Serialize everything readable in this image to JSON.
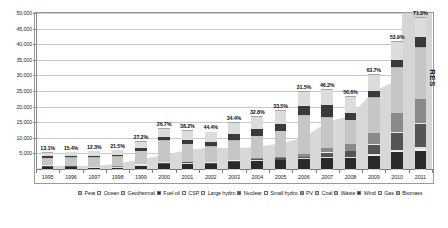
{
  "chart_data": {
    "type": "bar",
    "title": "",
    "subtitle": "",
    "xlabel": "",
    "ylabel": "",
    "ylim": [
      0,
      50000
    ],
    "yticks": [
      "5,000",
      "10,000",
      "15,000",
      "20,000",
      "25,000",
      "30,000",
      "35,000",
      "40,000",
      "45,000",
      "50,000"
    ],
    "ytick_values": [
      5000,
      10000,
      15000,
      20000,
      25000,
      30000,
      35000,
      40000,
      45000,
      50000
    ],
    "grid": true,
    "legend_position": "bottom",
    "stacked": true,
    "categories": [
      "1995",
      "1996",
      "1997",
      "1998",
      "1999",
      "2000",
      "2001",
      "2002",
      "2003",
      "2004",
      "2005",
      "2006",
      "2007",
      "2008",
      "2009",
      "2010",
      "2011"
    ],
    "annotations": [
      "13.1%",
      "15.4%",
      "12.3%",
      "21.5%",
      "27.2%",
      "26.7%",
      "38.2%",
      "44.4%",
      "34.4%",
      "32.8%",
      "33.5%",
      "31.5%",
      "46.2%",
      "56.6%",
      "63.7%",
      "53.9%",
      "71.3%"
    ],
    "annotation_label": "RES share of new capacity",
    "side_band_label": "RES",
    "series": [
      {
        "name": "Peat",
        "color": "#bdbdbd",
        "values": [
          60,
          50,
          40,
          40,
          30,
          30,
          25,
          25,
          20,
          20,
          20,
          15,
          15,
          15,
          10,
          10,
          10
        ]
      },
      {
        "name": "Ocean",
        "color": "#e4e4e4",
        "values": [
          5,
          5,
          5,
          5,
          5,
          5,
          5,
          5,
          5,
          5,
          5,
          5,
          5,
          5,
          5,
          5,
          5
        ]
      },
      {
        "name": "Geothermal",
        "color": "#cfcfcf",
        "values": [
          30,
          30,
          30,
          30,
          30,
          30,
          30,
          30,
          30,
          30,
          30,
          30,
          30,
          30,
          30,
          30,
          30
        ]
      },
      {
        "name": "Fuel oil",
        "color": "#2a2a2a",
        "values": [
          520,
          430,
          300,
          380,
          900,
          1450,
          1600,
          1500,
          2100,
          2450,
          2700,
          3050,
          3450,
          3550,
          4300,
          5400,
          5900
        ]
      },
      {
        "name": "CSP",
        "color": "#f0f0f0",
        "values": [
          0,
          0,
          0,
          0,
          0,
          0,
          0,
          0,
          0,
          10,
          20,
          30,
          60,
          90,
          260,
          450,
          620
        ]
      },
      {
        "name": "Large hydro",
        "color": "#e0e0e0",
        "values": [
          170,
          150,
          140,
          130,
          200,
          220,
          210,
          200,
          230,
          250,
          260,
          280,
          300,
          320,
          350,
          380,
          400
        ]
      },
      {
        "name": "Nuclear",
        "color": "#555555",
        "values": [
          300,
          250,
          180,
          160,
          260,
          320,
          300,
          280,
          340,
          380,
          400,
          430,
          1350,
          1700,
          2900,
          5400,
          7600
        ]
      },
      {
        "name": "Small hydro",
        "color": "#ededed",
        "values": [
          110,
          100,
          95,
          90,
          130,
          140,
          135,
          130,
          150,
          160,
          165,
          175,
          185,
          195,
          210,
          220,
          230
        ]
      },
      {
        "name": "PV",
        "color": "#8a8a8a",
        "values": [
          10,
          12,
          14,
          18,
          25,
          35,
          45,
          60,
          90,
          160,
          300,
          700,
          1300,
          2100,
          3500,
          6000,
          7700
        ]
      },
      {
        "name": "Coal",
        "color": "#c6c6c6",
        "values": [
          2400,
          2600,
          2900,
          3100,
          4100,
          6800,
          5600,
          4900,
          6200,
          7100,
          8200,
          12300,
          9800,
          7600,
          11200,
          14600,
          16400
        ]
      },
      {
        "name": "Waste",
        "color": "#b2b2b2",
        "values": [
          120,
          120,
          110,
          110,
          150,
          160,
          150,
          145,
          170,
          180,
          185,
          190,
          200,
          210,
          230,
          250,
          260
        ]
      },
      {
        "name": "Wind",
        "color": "#3a3a3a",
        "values": [
          350,
          420,
          450,
          520,
          900,
          1100,
          1300,
          1500,
          1900,
          2100,
          2300,
          2900,
          3800,
          2300,
          1900,
          2300,
          3100
        ]
      },
      {
        "name": "Gas",
        "color": "#dcdcdc",
        "values": [
          1200,
          1300,
          1450,
          1500,
          2100,
          2600,
          2900,
          3100,
          3600,
          3900,
          4200,
          4600,
          4900,
          5100,
          5400,
          5800,
          6200
        ]
      },
      {
        "name": "Biomass",
        "color": "#a5a5a5",
        "values": [
          140,
          140,
          140,
          140,
          190,
          200,
          195,
          190,
          220,
          230,
          240,
          250,
          265,
          280,
          300,
          320,
          340
        ]
      }
    ],
    "totals": [
      5415,
      5607,
      5854,
      6223,
      9021,
      13090,
      12495,
      12065,
      15055,
      16975,
      19025,
      24905,
      25660,
      23595,
      30595,
      41165,
      48795
    ]
  },
  "legend": {
    "items": [
      {
        "label": "Peat"
      },
      {
        "label": "Ocean"
      },
      {
        "label": "Geothermal"
      },
      {
        "label": "Fuel oil"
      },
      {
        "label": "CSP"
      },
      {
        "label": "Large hydro"
      },
      {
        "label": "Nuclear"
      },
      {
        "label": "Small hydro"
      },
      {
        "label": "PV"
      },
      {
        "label": "Coal"
      },
      {
        "label": "Waste"
      },
      {
        "label": "Wind"
      },
      {
        "label": "Gas"
      },
      {
        "label": "Biomass"
      }
    ]
  }
}
